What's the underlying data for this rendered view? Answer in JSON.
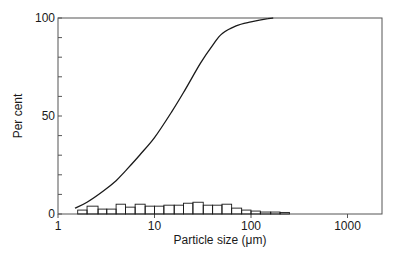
{
  "chart_data": {
    "type": "line",
    "title": "",
    "xlabel": "Particle size (μm)",
    "ylabel": "Per cent",
    "xscale": "log",
    "xlim": [
      1,
      2000
    ],
    "ylim": [
      0,
      100
    ],
    "xticks": [
      1,
      10,
      100,
      1000
    ],
    "xtick_labels": [
      "1",
      "10",
      "100",
      "1000"
    ],
    "yticks_major": [
      0,
      50,
      100
    ],
    "ytick_labels": [
      "0",
      "50",
      "100"
    ],
    "yticks_minor_step": 10,
    "grid": false,
    "legend": null,
    "series": [
      {
        "name": "Cumulative undersize",
        "kind": "line",
        "x": [
          1.5,
          2,
          3,
          4,
          5,
          7,
          10,
          15,
          20,
          30,
          40,
          50,
          70,
          100,
          150,
          170
        ],
        "y": [
          3,
          6,
          12,
          17,
          22,
          30,
          39,
          52,
          62,
          77,
          86,
          92,
          96,
          98,
          99.7,
          100
        ]
      },
      {
        "name": "Frequency distribution",
        "kind": "histogram",
        "bins": [
          {
            "x0": 1.6,
            "x1": 2.0,
            "y": 2
          },
          {
            "x0": 2.0,
            "x1": 2.6,
            "y": 4
          },
          {
            "x0": 2.6,
            "x1": 3.2,
            "y": 2.5
          },
          {
            "x0": 3.2,
            "x1": 4.0,
            "y": 2.5
          },
          {
            "x0": 4.0,
            "x1": 5.0,
            "y": 5
          },
          {
            "x0": 5.0,
            "x1": 6.3,
            "y": 3.5
          },
          {
            "x0": 6.3,
            "x1": 8.0,
            "y": 5
          },
          {
            "x0": 8.0,
            "x1": 10.0,
            "y": 4
          },
          {
            "x0": 10.0,
            "x1": 12.5,
            "y": 4
          },
          {
            "x0": 12.5,
            "x1": 16.0,
            "y": 4.5
          },
          {
            "x0": 16.0,
            "x1": 20.0,
            "y": 4.5
          },
          {
            "x0": 20.0,
            "x1": 25.0,
            "y": 5.5
          },
          {
            "x0": 25.0,
            "x1": 32.0,
            "y": 6
          },
          {
            "x0": 32.0,
            "x1": 40.0,
            "y": 4.5
          },
          {
            "x0": 40.0,
            "x1": 50.0,
            "y": 4.5
          },
          {
            "x0": 50.0,
            "x1": 63.0,
            "y": 5
          },
          {
            "x0": 63.0,
            "x1": 80.0,
            "y": 3
          },
          {
            "x0": 80.0,
            "x1": 100.0,
            "y": 2
          },
          {
            "x0": 100.0,
            "x1": 125.0,
            "y": 1.5
          },
          {
            "x0": 125.0,
            "x1": 160.0,
            "y": 1
          },
          {
            "x0": 160.0,
            "x1": 200.0,
            "y": 1
          },
          {
            "x0": 200.0,
            "x1": 250.0,
            "y": 0.8
          }
        ]
      }
    ]
  },
  "axes": {
    "x_label": "Particle size (μm)",
    "y_label": "Per cent",
    "x_tick_labels": [
      "1",
      "10",
      "100",
      "1000"
    ],
    "y_tick_labels": [
      "0",
      "50",
      "100"
    ]
  },
  "style": {
    "line_color": "#1a1a1a",
    "frame_color": "#555555",
    "background": "#ffffff"
  }
}
